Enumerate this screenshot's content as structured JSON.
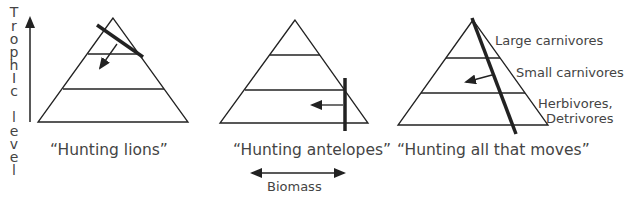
{
  "axis": {
    "label_letters": [
      "T",
      "r",
      "o",
      "p",
      "h",
      "I",
      "c",
      "",
      "l",
      "e",
      "v",
      "e",
      "l"
    ],
    "label": "Trophic level"
  },
  "pyramids": [
    {
      "id": "lions",
      "caption": "“Hunting lions”"
    },
    {
      "id": "antelopes",
      "caption": "“Hunting antelopes”"
    },
    {
      "id": "all",
      "caption": "“Hunting all that moves”"
    }
  ],
  "levels": {
    "top": "Large carnivores",
    "middle": "Small carnivores",
    "bottom_1": "Herbivores,",
    "bottom_2": "Detrivores"
  },
  "biomass": {
    "label": "Biomass"
  },
  "colors": {
    "line": "#222222",
    "text": "#444444"
  }
}
